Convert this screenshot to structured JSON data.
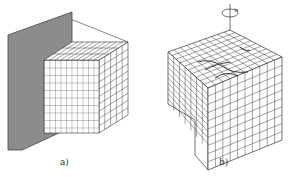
{
  "figure": {
    "panels": [
      {
        "id": "a",
        "label": "a)",
        "description": "Voxel cube partially intersecting a gray cutting plane",
        "plate_color": "#8c8c8c",
        "grid_divisions": 10
      },
      {
        "id": "b",
        "label": "b)",
        "description": "Voxel cube with twisted/deformed top surface and rotation axis arrow",
        "rotation_icon": "rotation-arrow-icon",
        "grid_divisions": 10
      }
    ],
    "line_color": "#333333"
  }
}
